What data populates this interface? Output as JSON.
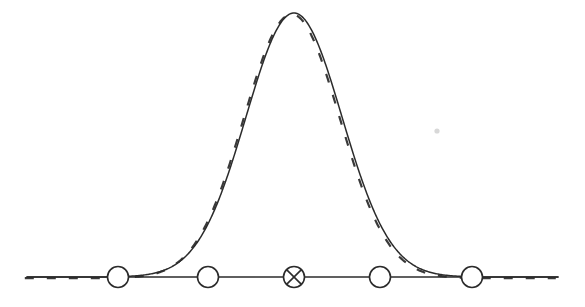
{
  "figure": {
    "width": 585,
    "height": 307,
    "background_color": "#ffffff",
    "ink_color": "#2b2b2b",
    "faint_mark_color": "#d8d8d8"
  },
  "axis": {
    "name": "horizontal-baseline",
    "x_start": 27,
    "x_end": 558,
    "y": 277,
    "stroke_width": 1.4,
    "color": "#2b2b2b"
  },
  "markers": {
    "radius": 10.5,
    "stroke_width": 1.6,
    "color": "#2b2b2b",
    "fill": "#ffffff",
    "items": [
      {
        "id": "node-1",
        "label": "open-circle",
        "glyph": "O",
        "cx": 118,
        "cy": 277,
        "crossed": false
      },
      {
        "id": "node-2",
        "label": "open-circle",
        "glyph": "O",
        "cx": 208,
        "cy": 277,
        "crossed": false
      },
      {
        "id": "node-3",
        "label": "crossed-circle",
        "glyph": "⊗",
        "cx": 294,
        "cy": 277,
        "crossed": true
      },
      {
        "id": "node-4",
        "label": "open-circle",
        "glyph": "O",
        "cx": 380,
        "cy": 277,
        "crossed": false
      },
      {
        "id": "node-5",
        "label": "open-circle",
        "glyph": "O",
        "cx": 472,
        "cy": 277,
        "crossed": false
      }
    ]
  },
  "faint_mark": {
    "name": "faint-speck",
    "cx": 437,
    "cy": 131,
    "r": 2.6,
    "color": "#d8d8d8"
  },
  "chart_data": {
    "type": "line",
    "title": "",
    "subtitle": "",
    "xlabel": "",
    "ylabel": "",
    "grid": false,
    "legend_position": "none",
    "xlim": [
      27,
      558
    ],
    "ylim": [
      0,
      264
    ],
    "baseline_y": 277,
    "peak": {
      "x": 294,
      "y": 13,
      "height": 264
    },
    "gaussian": {
      "mean_x": 294,
      "sigma_x": 48.0,
      "amplitude": 264
    },
    "series": [
      {
        "name": "solid-gaussian",
        "style": "solid",
        "color": "#2b2b2b",
        "stroke_width": 1.5,
        "offset_x": 0,
        "offset_y": 0,
        "dash_pattern": ""
      },
      {
        "name": "dashed-gaussian",
        "style": "dashed",
        "color": "#3a3a3a",
        "stroke_width": 2.2,
        "offset_x": -2.2,
        "offset_y": 1.2,
        "dash_pattern": "9 13"
      }
    ],
    "x": [
      27,
      60,
      90,
      118,
      140,
      160,
      180,
      200,
      208,
      220,
      240,
      255,
      270,
      285,
      294,
      305,
      320,
      335,
      350,
      365,
      380,
      400,
      420,
      440,
      460,
      472,
      500,
      530,
      558
    ],
    "y": [
      0,
      0,
      1,
      2,
      5,
      11,
      25,
      52,
      66,
      97,
      168,
      215,
      248,
      262,
      264,
      259,
      235,
      196,
      148,
      102,
      66,
      29,
      9,
      2,
      1,
      0,
      0,
      0,
      0
    ]
  }
}
